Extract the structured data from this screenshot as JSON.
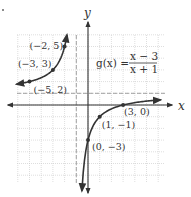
{
  "chart_data": {
    "type": "line",
    "title": "",
    "function_label": "g(x) =",
    "numerator": "x − 3",
    "denominator": "x + 1",
    "xlabel": "x",
    "ylabel": "y",
    "xlim": [
      -6,
      6.5
    ],
    "ylim": [
      -6.7,
      6
    ],
    "grid": true,
    "asymptotes": {
      "vertical": -1,
      "horizontal": 1
    },
    "series": [
      {
        "name": "left branch",
        "x": [
          -6,
          -5,
          -4,
          -3,
          -2.5,
          -2,
          -1.8
        ],
        "y": [
          1.8,
          2,
          2.33,
          3,
          3.67,
          5,
          6
        ]
      },
      {
        "name": "right branch",
        "x": [
          -0.55,
          -0.4,
          -0.2,
          0,
          0.5,
          1,
          2,
          3,
          4,
          5,
          6.2
        ],
        "y": [
          -6.8,
          -5.67,
          -4,
          -3,
          -1.67,
          -1,
          -0.33,
          0,
          0.2,
          0.33,
          0.46
        ]
      }
    ],
    "points": [
      {
        "label": "(−2, 5)",
        "x": -2,
        "y": 5
      },
      {
        "label": "(−3, 3)",
        "x": -3,
        "y": 3
      },
      {
        "label": "(−5, 2)",
        "x": -5,
        "y": 2
      },
      {
        "label": "(3, 0)",
        "x": 3,
        "y": 0
      },
      {
        "label": "(1, −1)",
        "x": 1,
        "y": -1
      },
      {
        "label": "(0, −3)",
        "x": 0,
        "y": -3
      }
    ]
  },
  "layout": {
    "origin_px": [
      88,
      105
    ],
    "unit_px": 11.7,
    "grid_px": {
      "left": 17,
      "right": 165,
      "top": 35,
      "bottom": 183
    },
    "colors": {
      "curve": "#333333",
      "axis": "#333333",
      "grid": "#c8c8c8",
      "dashed": "#999999"
    }
  }
}
